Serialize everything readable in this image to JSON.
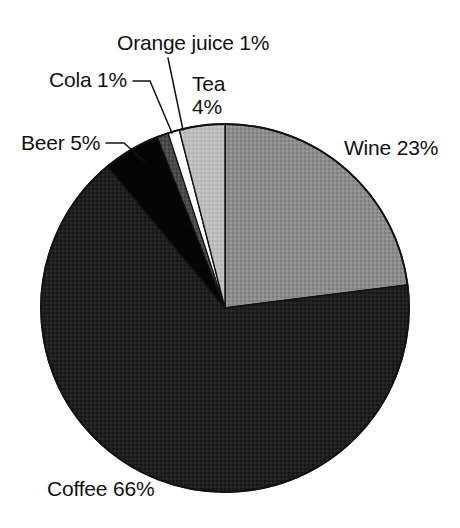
{
  "chart_data": {
    "type": "pie",
    "title": "",
    "subtitle": "",
    "xlabel": "",
    "ylabel": "",
    "legend_position": "none",
    "grid": false,
    "units": "percent",
    "total": 100,
    "start_angle_deg": 0,
    "direction": "clockwise",
    "categories": [
      "Wine",
      "Coffee",
      "Beer",
      "Cola",
      "Orange juice",
      "Tea"
    ],
    "values": [
      23,
      66,
      5,
      1,
      1,
      4
    ],
    "slices": [
      {
        "name": "Wine",
        "value": 23,
        "label": "Wine 23%",
        "label_name": "Wine",
        "label_value": "23%",
        "color": "#8c8c8c",
        "start_deg": 0,
        "end_deg": 82.8
      },
      {
        "name": "Coffee",
        "value": 66,
        "label": "Coffee 66%",
        "label_name": "Coffee",
        "label_value": "66%",
        "color": "#1e1e1e",
        "start_deg": 82.8,
        "end_deg": 320.4
      },
      {
        "name": "Beer",
        "value": 5,
        "label": "Beer 5%",
        "label_name": "Beer",
        "label_value": "5%",
        "color": "#050505",
        "start_deg": 320.4,
        "end_deg": 338.4
      },
      {
        "name": "Cola",
        "value": 1,
        "label": "Cola 1%",
        "label_name": "Cola",
        "label_value": "1%",
        "color": "#4a4a4a",
        "start_deg": 338.4,
        "end_deg": 342.0
      },
      {
        "name": "Orange juice",
        "value": 1,
        "label": "Orange juice 1%",
        "label_name": "Orange juice",
        "label_value": "1%",
        "color": "#ffffff",
        "start_deg": 342.0,
        "end_deg": 345.6
      },
      {
        "name": "Tea",
        "value": 4,
        "label": "Tea 4%",
        "label_name": "Tea",
        "label_value": "4%",
        "label_line1": "Tea",
        "label_line2": "4%",
        "color": "#bcbcbc",
        "start_deg": 345.6,
        "end_deg": 360.0
      }
    ]
  },
  "labels": {
    "orange_juice": "Orange juice 1%",
    "cola": "Cola 1%",
    "beer": "Beer 5%",
    "tea_line1": "Tea",
    "tea_line2": "4%",
    "wine": "Wine 23%",
    "coffee": "Coffee 66%"
  },
  "colors": {
    "background": "#ffffff",
    "outline": "#111111",
    "text": "#111111",
    "wine": "#8c8c8c",
    "coffee": "#1e1e1e",
    "beer": "#050505",
    "cola": "#4a4a4a",
    "orange_juice": "#ffffff",
    "tea": "#bcbcbc"
  }
}
